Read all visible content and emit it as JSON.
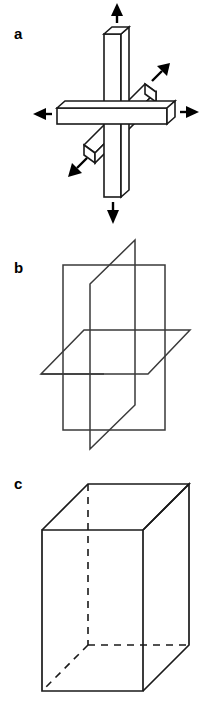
{
  "figure": {
    "type": "scientific-line-diagram",
    "background_color": "#ffffff",
    "stroke_color": "#1a1a1a",
    "fill_color": "#ffffff",
    "panel_count": 3
  },
  "panels": [
    {
      "id": "a",
      "label": "a",
      "description": "Three mutually perpendicular rectangular bars intersecting at a common center, drawn in 3D oblique projection, with six arrows indicating outward expansion along each of the three axes in both directions.",
      "arrow_count": 6,
      "bar_count": 3,
      "arrows": [
        {
          "name": "arrow-up",
          "direction": "up"
        },
        {
          "name": "arrow-down",
          "direction": "down"
        },
        {
          "name": "arrow-left",
          "direction": "left"
        },
        {
          "name": "arrow-right",
          "direction": "right"
        },
        {
          "name": "arrow-depth-out",
          "direction": "upper-right-diagonal"
        },
        {
          "name": "arrow-depth-in",
          "direction": "lower-left-diagonal"
        }
      ]
    },
    {
      "id": "b",
      "label": "b",
      "description": "Three mutually perpendicular planes intersecting: two vertical planes and one horizontal plane, drawn as outline parallelograms in 3D oblique projection.",
      "plane_count": 3
    },
    {
      "id": "c",
      "label": "c",
      "description": "A rectangular box (cuboid) drawn in 3D oblique projection with the three hidden rear edges rendered as dashed lines.",
      "hidden_edge_style": "dashed",
      "hidden_edge_count": 3
    }
  ]
}
